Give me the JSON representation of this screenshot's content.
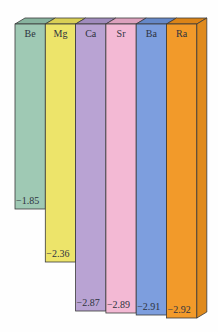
{
  "chart_data": {
    "type": "bar",
    "title": "",
    "xlabel": "",
    "ylabel": "",
    "orientation": "vertical (bars hang downward, length proportional to magnitude of negative value)",
    "style": "3D bars",
    "grid": false,
    "legend": null,
    "categories": [
      "Be",
      "Mg",
      "Ca",
      "Sr",
      "Ba",
      "Ra"
    ],
    "values": [
      -1.85,
      -2.36,
      -2.87,
      -2.89,
      -2.91,
      -2.92
    ],
    "value_labels": [
      "−1.85",
      "−2.36",
      "−2.87",
      "−2.89",
      "−2.91",
      "−2.92"
    ],
    "colors": [
      "#9fc9b4",
      "#ede46a",
      "#b9a3d3",
      "#f3b9d4",
      "#7d9ede",
      "#f29a2a"
    ],
    "top_colors": [
      "#87b39e",
      "#d9cf55",
      "#a08bbd",
      "#dca1bd",
      "#6588c8",
      "#db8417"
    ],
    "side_color": "#e08a1c",
    "ylim": [
      0,
      -3
    ]
  },
  "geometry": {
    "x0": 15,
    "bar_width": 30.3,
    "top_y": 24,
    "depth_x": 10,
    "depth_y": 6,
    "bottoms": [
      209,
      262,
      311,
      313,
      315,
      318
    ]
  }
}
